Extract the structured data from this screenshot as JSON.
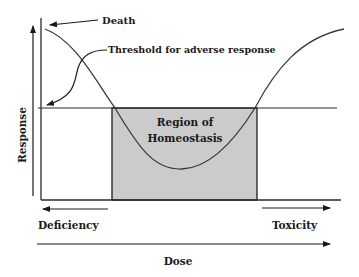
{
  "diagram": {
    "type": "dose-response",
    "labels": {
      "death": "Death",
      "threshold": "Threshold for adverse response",
      "region_line1": "Region of",
      "region_line2": "Homeostasis",
      "y_axis": "Response",
      "x_axis": "Dose",
      "deficiency": "Deficiency",
      "toxicity": "Toxicity"
    },
    "colors": {
      "line": "#3a3a3a",
      "region_fill": "#cbcbcb",
      "text": "#1a1a1a",
      "background": "#ffffff"
    }
  }
}
